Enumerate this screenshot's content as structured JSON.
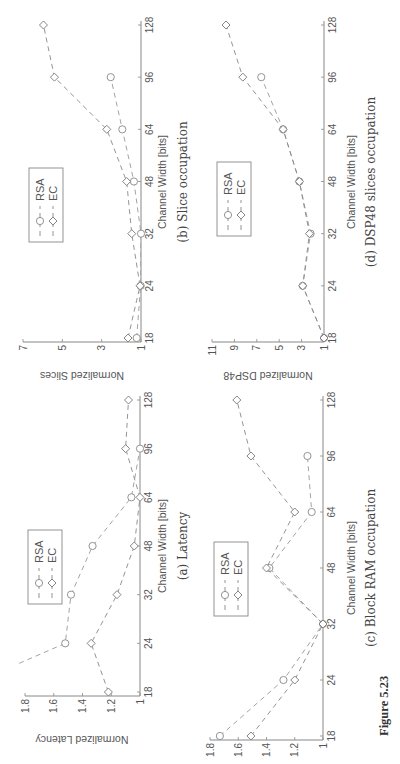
{
  "figure": {
    "caption": "Figure 5.23"
  },
  "legend": {
    "series": [
      "RSA",
      "EC"
    ]
  },
  "chart_data": [
    {
      "id": "a",
      "type": "line",
      "title": "(a) Latency",
      "xlabel": "Channel Width [bits]",
      "ylabel": "Normalized Latency",
      "categories": [
        18,
        24,
        32,
        48,
        64,
        96,
        128
      ],
      "yticks": [
        "1",
        "1.2",
        "1.4",
        "1.6",
        "1.8"
      ],
      "ylim": [
        1,
        1.8
      ],
      "series": [
        {
          "name": "RSA",
          "marker": "circle",
          "values": [
            2.3,
            1.52,
            1.48,
            1.33,
            1.06,
            1.0,
            null
          ]
        },
        {
          "name": "EC",
          "marker": "diamond",
          "values": [
            1.22,
            1.34,
            1.16,
            1.04,
            1.0,
            1.1,
            1.08
          ]
        }
      ],
      "grid": false,
      "legend_position": "top-center"
    },
    {
      "id": "b",
      "type": "line",
      "title": "(b) Slice occupation",
      "xlabel": "Channel Width [bits]",
      "ylabel": "Normalized Slices",
      "categories": [
        18,
        24,
        32,
        48,
        64,
        96,
        128
      ],
      "yticks": [
        "1",
        "3",
        "5",
        "7"
      ],
      "ylim": [
        1,
        7
      ],
      "series": [
        {
          "name": "RSA",
          "marker": "circle",
          "values": [
            1.22,
            1.02,
            1.0,
            1.36,
            1.95,
            2.54,
            null
          ]
        },
        {
          "name": "EC",
          "marker": "diamond",
          "values": [
            1.66,
            1.05,
            1.47,
            1.73,
            2.74,
            5.4,
            5.96
          ]
        }
      ],
      "grid": false,
      "legend_position": "top-center"
    },
    {
      "id": "c",
      "type": "line",
      "title": "(c) Block RAM occupation",
      "xlabel": "Channel Width [bits]",
      "ylabel": "Normalized BRAMs",
      "categories": [
        18,
        24,
        32,
        48,
        64,
        96,
        128
      ],
      "yticks": [
        "1",
        "1.2",
        "1.4",
        "1.6",
        "1.8"
      ],
      "ylim": [
        1,
        1.8
      ],
      "series": [
        {
          "name": "RSA",
          "marker": "circle",
          "values": [
            1.73,
            1.28,
            1.0,
            1.38,
            1.08,
            1.11,
            null
          ]
        },
        {
          "name": "EC",
          "marker": "diamond",
          "values": [
            1.51,
            1.2,
            1.0,
            1.4,
            1.2,
            1.51,
            1.61
          ]
        }
      ],
      "grid": false,
      "legend_position": "top-center"
    },
    {
      "id": "d",
      "type": "line",
      "title": "(d) DSP48 slices occupation",
      "xlabel": "Channel Width [bits]",
      "ylabel": "Normalized DSP48",
      "categories": [
        18,
        24,
        32,
        48,
        64,
        96,
        128
      ],
      "yticks": [
        "1",
        "3",
        "5",
        "7",
        "9",
        "11"
      ],
      "ylim": [
        1,
        11
      ],
      "series": [
        {
          "name": "RSA",
          "marker": "circle",
          "values": [
            1.0,
            2.9,
            2.2,
            3.2,
            4.65,
            6.6,
            null
          ]
        },
        {
          "name": "EC",
          "marker": "diamond",
          "values": [
            1.0,
            2.9,
            2.3,
            3.2,
            4.65,
            8.25,
            9.75
          ]
        }
      ],
      "grid": false,
      "legend_position": "top-center"
    }
  ]
}
